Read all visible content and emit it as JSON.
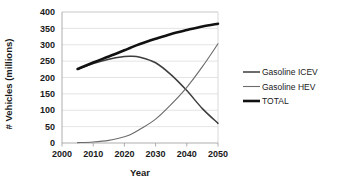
{
  "chart_data": {
    "type": "line",
    "title": "",
    "xlabel": "Year",
    "ylabel": "# Vehicles (millions)",
    "xlim": [
      2000,
      2050
    ],
    "ylim": [
      0,
      400
    ],
    "xticks": [
      "2000",
      "2010",
      "2020",
      "2030",
      "2040",
      "2050"
    ],
    "yticks": [
      "0",
      "50",
      "100",
      "150",
      "200",
      "250",
      "300",
      "350",
      "400"
    ],
    "grid": "horizontal",
    "legend_position": "right",
    "x": [
      2005,
      2010,
      2015,
      2020,
      2022,
      2025,
      2030,
      2035,
      2040,
      2045,
      2050
    ],
    "series": [
      {
        "name": "Gasoline ICEV",
        "color": "#3d3d3d",
        "width": 1.5,
        "values": [
          225,
          243,
          256,
          264,
          265,
          262,
          245,
          208,
          160,
          105,
          60
        ]
      },
      {
        "name": "Gasoline HEV",
        "color": "#6b6b6b",
        "width": 1.1,
        "values": [
          1,
          3,
          8,
          19,
          26,
          42,
          73,
          118,
          170,
          233,
          303
        ]
      },
      {
        "name": "TOTAL",
        "color": "#111111",
        "width": 2.6,
        "values": [
          226,
          246,
          264,
          283,
          291,
          302,
          318,
          333,
          345,
          356,
          364
        ]
      }
    ]
  },
  "legend": {
    "items": [
      {
        "label": "Gasoline ICEV"
      },
      {
        "label": "Gasoline HEV"
      },
      {
        "label": "TOTAL"
      }
    ]
  },
  "axes": {
    "x_title": "Year",
    "y_title": "# Vehicles (millions)"
  }
}
